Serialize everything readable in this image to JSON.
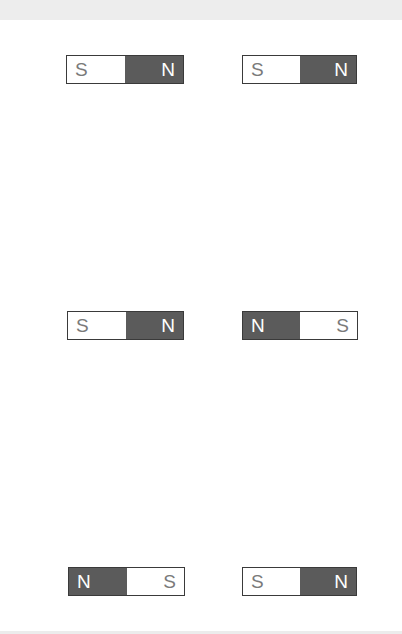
{
  "colors": {
    "north_fill": "#5b5b5b",
    "south_fill": "#ffffff",
    "border": "#3a3a3a",
    "south_text": "#7a7a7a",
    "north_text": "#ffffff"
  },
  "magnets": [
    {
      "left": "S",
      "right": "N"
    },
    {
      "left": "S",
      "right": "N"
    },
    {
      "left": "S",
      "right": "N"
    },
    {
      "left": "N",
      "right": "S"
    },
    {
      "left": "N",
      "right": "S"
    },
    {
      "left": "S",
      "right": "N"
    }
  ]
}
